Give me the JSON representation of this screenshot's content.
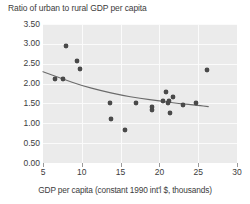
{
  "chart_data": {
    "type": "scatter",
    "title": "Ratio of urban to rural GDP per capita",
    "xlabel": "GDP per capita (constant 1990 int'l $, thousands)",
    "ylabel": "",
    "xlim": [
      5,
      30
    ],
    "ylim": [
      0.0,
      3.5
    ],
    "xticks": [
      "5",
      "10",
      "15",
      "20",
      "25",
      "30"
    ],
    "xtick_values": [
      5,
      10,
      15,
      20,
      25,
      30
    ],
    "yticks": [
      "0.00",
      "0.50",
      "1.00",
      "1.50",
      "2.00",
      "2.50",
      "3.00",
      "3.50"
    ],
    "ytick_values": [
      0.0,
      0.5,
      1.0,
      1.5,
      2.0,
      2.5,
      3.0,
      3.5
    ],
    "grid": true,
    "legend": null,
    "marker_color": "#4a4a4a",
    "trend_color": "#6b6b6b",
    "plot_background": "#ebebeb",
    "gridline_color": "#fbfbfb",
    "points": [
      {
        "x": 6.6,
        "y": 2.12
      },
      {
        "x": 7.6,
        "y": 2.11
      },
      {
        "x": 7.9,
        "y": 2.95
      },
      {
        "x": 9.4,
        "y": 2.58
      },
      {
        "x": 9.8,
        "y": 2.37
      },
      {
        "x": 13.6,
        "y": 1.51
      },
      {
        "x": 13.8,
        "y": 1.12
      },
      {
        "x": 15.6,
        "y": 0.82
      },
      {
        "x": 17.0,
        "y": 1.5
      },
      {
        "x": 19.0,
        "y": 1.4
      },
      {
        "x": 19.1,
        "y": 1.33
      },
      {
        "x": 20.4,
        "y": 1.57
      },
      {
        "x": 20.8,
        "y": 1.8
      },
      {
        "x": 21.1,
        "y": 1.52
      },
      {
        "x": 21.3,
        "y": 1.55
      },
      {
        "x": 21.4,
        "y": 1.27
      },
      {
        "x": 21.7,
        "y": 1.67
      },
      {
        "x": 23.0,
        "y": 1.45
      },
      {
        "x": 24.7,
        "y": 1.52
      },
      {
        "x": 26.1,
        "y": 2.33
      }
    ],
    "trend_line": {
      "type": "fitted-curve",
      "points": [
        {
          "x": 5.0,
          "y": 2.3
        },
        {
          "x": 7.5,
          "y": 2.12
        },
        {
          "x": 10.0,
          "y": 1.95
        },
        {
          "x": 12.5,
          "y": 1.82
        },
        {
          "x": 15.0,
          "y": 1.71
        },
        {
          "x": 17.5,
          "y": 1.63
        },
        {
          "x": 20.0,
          "y": 1.56
        },
        {
          "x": 22.5,
          "y": 1.5
        },
        {
          "x": 25.0,
          "y": 1.45
        },
        {
          "x": 26.3,
          "y": 1.42
        }
      ]
    }
  }
}
